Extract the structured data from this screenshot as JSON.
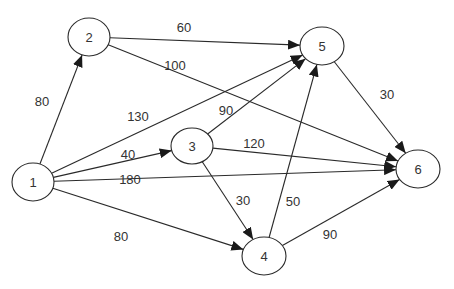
{
  "diagram": {
    "type": "directed-weighted-graph",
    "colors": {
      "stroke": "#2a2a2a",
      "text": "#333333",
      "background": "#ffffff"
    },
    "nodes": [
      {
        "id": "1",
        "label": "1",
        "cx": 33,
        "cy": 182,
        "rx": 21,
        "ry": 19
      },
      {
        "id": "2",
        "label": "2",
        "cx": 89,
        "cy": 37,
        "rx": 21,
        "ry": 19
      },
      {
        "id": "3",
        "label": "3",
        "cx": 192,
        "cy": 146,
        "rx": 21,
        "ry": 18
      },
      {
        "id": "4",
        "label": "4",
        "cx": 264,
        "cy": 256,
        "rx": 22,
        "ry": 19
      },
      {
        "id": "5",
        "label": "5",
        "cx": 322,
        "cy": 46,
        "rx": 22,
        "ry": 19
      },
      {
        "id": "6",
        "label": "6",
        "cx": 418,
        "cy": 169,
        "rx": 22,
        "ry": 19
      }
    ],
    "edges": [
      {
        "from": "1",
        "to": "2",
        "weight": "80",
        "lx": 42,
        "ly": 106
      },
      {
        "from": "1",
        "to": "5",
        "weight": "130",
        "lx": 138,
        "ly": 121
      },
      {
        "from": "1",
        "to": "3",
        "weight": "40",
        "lx": 128,
        "ly": 159
      },
      {
        "from": "1",
        "to": "6",
        "weight": "180",
        "lx": 130,
        "ly": 184
      },
      {
        "from": "1",
        "to": "4",
        "weight": "80",
        "lx": 121,
        "ly": 241
      },
      {
        "from": "2",
        "to": "5",
        "weight": "60",
        "lx": 184,
        "ly": 32
      },
      {
        "from": "2",
        "to": "6",
        "weight": "100",
        "lx": 175,
        "ly": 70
      },
      {
        "from": "3",
        "to": "5",
        "weight": "90",
        "lx": 226,
        "ly": 115
      },
      {
        "from": "3",
        "to": "6",
        "weight": "120",
        "lx": 254,
        "ly": 148
      },
      {
        "from": "3",
        "to": "4",
        "weight": "30",
        "lx": 243,
        "ly": 205
      },
      {
        "from": "4",
        "to": "5",
        "weight": "50",
        "lx": 293,
        "ly": 206
      },
      {
        "from": "4",
        "to": "6",
        "weight": "90",
        "lx": 330,
        "ly": 239
      },
      {
        "from": "5",
        "to": "6",
        "weight": "30",
        "lx": 387,
        "ly": 99
      }
    ]
  }
}
